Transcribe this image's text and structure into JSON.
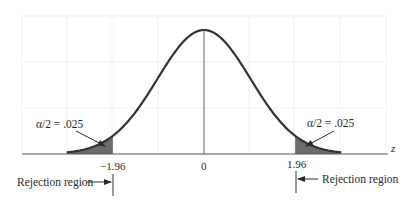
{
  "chart_data": {
    "type": "area",
    "title": "",
    "xlabel": "z",
    "ylabel": "",
    "xlim": [
      -3.9,
      4.0
    ],
    "x_ticks": [
      {
        "value": -1.96,
        "label": "-1.96"
      },
      {
        "value": 0,
        "label": "0"
      },
      {
        "value": 1.96,
        "label": "1.96"
      }
    ],
    "series": [
      {
        "name": "standard normal pdf",
        "mean": 0,
        "sd": 1
      }
    ],
    "shaded_regions": [
      {
        "name": "left tail",
        "from": "-inf",
        "to": -1.96,
        "area": 0.025,
        "label": "α/2 = .025"
      },
      {
        "name": "right tail",
        "from": 1.96,
        "to": "inf",
        "area": 0.025,
        "label": "α/2 = .025"
      }
    ],
    "annotations": [
      {
        "text": "Rejection region",
        "position": "left of -1.96",
        "arrow": "points right"
      },
      {
        "text": "Rejection region",
        "position": "right of 1.96",
        "arrow": "points left"
      }
    ],
    "grid": true,
    "colors": {
      "curve": "#333333",
      "shade": "#6b6b6b",
      "axis": "#555555",
      "grid": "#eeeeee"
    }
  },
  "labels": {
    "left_alpha": "α/2 = .025",
    "right_alpha": "α/2 = .025",
    "left_crit": "−1.96",
    "center": "0",
    "right_crit": "1.96",
    "z_axis": "z",
    "left_rejection": "Rejection region",
    "right_rejection": "Rejection region"
  }
}
